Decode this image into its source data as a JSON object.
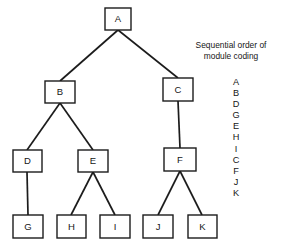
{
  "diagram": {
    "type": "tree",
    "stroke_color": "#1c1c1c",
    "node_fill": "#ffffff",
    "text_color": "#161616",
    "nodes": [
      {
        "id": "A",
        "label": "A",
        "x": 105,
        "y": 8,
        "w": 26,
        "h": 22,
        "level": 0
      },
      {
        "id": "B",
        "label": "B",
        "x": 45,
        "y": 81,
        "w": 30,
        "h": 22,
        "level": 1
      },
      {
        "id": "C",
        "label": "C",
        "x": 163,
        "y": 78,
        "w": 30,
        "h": 23,
        "level": 1
      },
      {
        "id": "D",
        "label": "D",
        "x": 13,
        "y": 150,
        "w": 29,
        "h": 22,
        "level": 2
      },
      {
        "id": "E",
        "label": "E",
        "x": 78,
        "y": 150,
        "w": 30,
        "h": 22,
        "level": 2
      },
      {
        "id": "F",
        "label": "F",
        "x": 164,
        "y": 148,
        "w": 32,
        "h": 23,
        "level": 2
      },
      {
        "id": "G",
        "label": "G",
        "x": 13,
        "y": 215,
        "w": 30,
        "h": 23,
        "level": 3
      },
      {
        "id": "H",
        "label": "H",
        "x": 57,
        "y": 215,
        "w": 29,
        "h": 23,
        "level": 3
      },
      {
        "id": "I",
        "label": "I",
        "x": 100,
        "y": 215,
        "w": 30,
        "h": 23,
        "level": 3
      },
      {
        "id": "J",
        "label": "J",
        "x": 143,
        "y": 215,
        "w": 30,
        "h": 23,
        "level": 3
      },
      {
        "id": "K",
        "label": "K",
        "x": 188,
        "y": 215,
        "w": 29,
        "h": 23,
        "level": 3
      }
    ],
    "edges": [
      {
        "from": "A",
        "to": "B",
        "x1": 118,
        "y1": 30,
        "x2": 60,
        "y2": 81
      },
      {
        "from": "A",
        "to": "C",
        "x1": 118,
        "y1": 30,
        "x2": 178,
        "y2": 78
      },
      {
        "from": "B",
        "to": "D",
        "x1": 60,
        "y1": 103,
        "x2": 27,
        "y2": 150
      },
      {
        "from": "B",
        "to": "E",
        "x1": 60,
        "y1": 103,
        "x2": 93,
        "y2": 150
      },
      {
        "from": "C",
        "to": "F",
        "x1": 178,
        "y1": 101,
        "x2": 180,
        "y2": 148
      },
      {
        "from": "D",
        "to": "G",
        "x1": 27,
        "y1": 172,
        "x2": 28,
        "y2": 215
      },
      {
        "from": "E",
        "to": "H",
        "x1": 93,
        "y1": 172,
        "x2": 71,
        "y2": 215
      },
      {
        "from": "E",
        "to": "I",
        "x1": 93,
        "y1": 172,
        "x2": 115,
        "y2": 215
      },
      {
        "from": "F",
        "to": "J",
        "x1": 180,
        "y1": 171,
        "x2": 158,
        "y2": 215
      },
      {
        "from": "F",
        "to": "K",
        "x1": 180,
        "y1": 171,
        "x2": 202,
        "y2": 215
      }
    ]
  },
  "legend": {
    "caption_line_1": "Sequential order of",
    "caption_line_2": "module coding",
    "sequence": [
      "A",
      "B",
      "D",
      "G",
      "E",
      "H",
      "I",
      "C",
      "F",
      "J",
      "K"
    ]
  }
}
